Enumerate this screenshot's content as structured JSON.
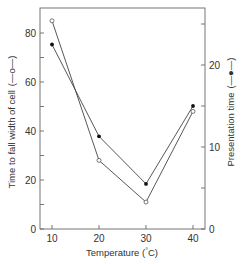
{
  "chart_data": {
    "type": "line",
    "title": "",
    "xlabel": "Temperature (°C)",
    "ylabel": "Time to fall width of cell (—o—)",
    "y2label": "Presentation time (—●—)",
    "x": [
      10,
      20,
      30,
      40
    ],
    "xticks": [
      "10",
      "20",
      "30",
      "40"
    ],
    "yticks": [
      "0",
      "20",
      "40",
      "60",
      "80"
    ],
    "y2ticks": [
      "0",
      "10",
      "20"
    ],
    "ylim": [
      0,
      90
    ],
    "y2lim": [
      0,
      27.5
    ],
    "grid": false,
    "legend": "inline in axis labels",
    "series": [
      {
        "name": "Time to fall width of cell",
        "marker": "open-circle",
        "axis": "left",
        "values": [
          85,
          28,
          11,
          48
        ]
      },
      {
        "name": "Presentation time",
        "marker": "filled-circle",
        "axis": "right",
        "values": [
          22.5,
          11.3,
          5.5,
          15
        ]
      }
    ]
  },
  "labels": {
    "xlabel": "Temperature (",
    "xlabel_deg": "°",
    "xlabel_unit": "C)",
    "ylabel": "Time to fall width of cell",
    "ylabel_legend": "(—o—)",
    "y2label": "Presentation time",
    "y2label_legend": "(—●—)"
  },
  "colors": {
    "line": "#444444",
    "axis": "#555555",
    "text": "#333333"
  }
}
